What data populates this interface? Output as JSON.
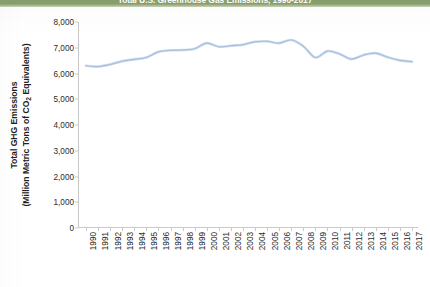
{
  "title": {
    "text": "Total U.S. Greenhouse Gas Emissions, 1990-2017",
    "band_color": "#8aa06c"
  },
  "axis": {
    "y_title_line1": "Total GHG  Emissions",
    "y_title_line2_pre": "(Million Metric Tons of CO",
    "y_title_line2_sub": "2",
    "y_title_line2_post": " Equivalents)"
  },
  "chart_data": {
    "type": "line",
    "title": "Total U.S. Greenhouse Gas Emissions, 1990-2017",
    "xlabel": "",
    "ylabel": "Total GHG Emissions (Million Metric Tons of CO2 Equivalents)",
    "ylim": [
      0,
      8000
    ],
    "yticks": [
      0,
      1000,
      2000,
      3000,
      4000,
      5000,
      6000,
      7000,
      8000
    ],
    "ytick_labels": [
      "0",
      "1,000",
      "2,000",
      "3,000",
      "4,000",
      "5,000",
      "6,000",
      "7,000",
      "8,000"
    ],
    "grid": false,
    "legend": "none",
    "line_color": "#a8c0de",
    "categories": [
      "1990",
      "1991",
      "1992",
      "1993",
      "1994",
      "1995",
      "1996",
      "1997",
      "1998",
      "1999",
      "2000",
      "2001",
      "2002",
      "2003",
      "2004",
      "2005",
      "2006",
      "2007",
      "2008",
      "2009",
      "2010",
      "2011",
      "2012",
      "2013",
      "2014",
      "2015",
      "2016",
      "2017"
    ],
    "series": [
      {
        "name": "Total GHG Emissions",
        "values": [
          6300,
          6270,
          6350,
          6480,
          6550,
          6620,
          6840,
          6900,
          6910,
          6960,
          7180,
          7040,
          7080,
          7120,
          7230,
          7250,
          7180,
          7300,
          7060,
          6620,
          6870,
          6760,
          6560,
          6720,
          6790,
          6630,
          6510,
          6460
        ]
      }
    ]
  }
}
